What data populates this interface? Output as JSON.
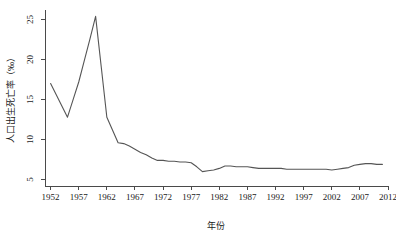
{
  "chart_data": {
    "type": "line",
    "title": "",
    "xlabel": "年份",
    "ylabel": "人口出生死亡率（‰）",
    "xlim": [
      1951,
      2012
    ],
    "ylim": [
      4.2,
      26.2
    ],
    "grid": false,
    "legend": null,
    "x_ticks": [
      1952,
      1957,
      1962,
      1967,
      1972,
      1977,
      1982,
      1987,
      1992,
      1997,
      2002,
      2007,
      2012
    ],
    "y_ticks": [
      5,
      10,
      15,
      20,
      25
    ],
    "series": [
      {
        "name": "人口出生死亡率",
        "color": "#555555",
        "x": [
          1952,
          1953,
          1954,
          1955,
          1956,
          1957,
          1958,
          1959,
          1960,
          1961,
          1962,
          1963,
          1964,
          1965,
          1966,
          1967,
          1968,
          1969,
          1970,
          1971,
          1972,
          1973,
          1974,
          1975,
          1976,
          1977,
          1978,
          1979,
          1980,
          1981,
          1982,
          1983,
          1984,
          1985,
          1986,
          1987,
          1988,
          1989,
          1990,
          1991,
          1992,
          1993,
          1994,
          1995,
          1996,
          1997,
          1998,
          1999,
          2000,
          2001,
          2002,
          2003,
          2004,
          2005,
          2006,
          2007,
          2008,
          2009,
          2010,
          2011
        ],
        "values": [
          17.0,
          15.6,
          14.2,
          12.8,
          15.0,
          17.2,
          19.9,
          22.6,
          25.4,
          19.1,
          12.8,
          11.2,
          9.6,
          9.5,
          9.2,
          8.8,
          8.4,
          8.1,
          7.7,
          7.4,
          7.4,
          7.3,
          7.3,
          7.2,
          7.2,
          7.1,
          6.6,
          6.0,
          6.1,
          6.2,
          6.4,
          6.7,
          6.7,
          6.6,
          6.6,
          6.6,
          6.5,
          6.4,
          6.4,
          6.4,
          6.4,
          6.4,
          6.3,
          6.3,
          6.3,
          6.3,
          6.3,
          6.3,
          6.3,
          6.3,
          6.2,
          6.3,
          6.4,
          6.5,
          6.8,
          6.9,
          7.0,
          7.0,
          6.9,
          6.9
        ]
      }
    ]
  },
  "axes": {
    "x_title": "年份",
    "y_title": "人口出生死亡率（‰）",
    "x_tick_labels": [
      "1952",
      "1957",
      "1962",
      "1967",
      "1972",
      "1977",
      "1982",
      "1987",
      "1992",
      "1997",
      "2002",
      "2007",
      "2012"
    ],
    "y_tick_labels": [
      "5",
      "10",
      "15",
      "20",
      "25"
    ]
  }
}
